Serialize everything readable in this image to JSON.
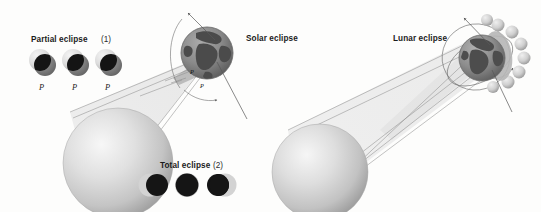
{
  "figure": {
    "background_color": "#fdfdfc",
    "width": 541,
    "height": 212
  },
  "labels": {
    "partial_eclipse": "Partial eclipse",
    "partial_eclipse_num": "(1)",
    "total_eclipse": "Total eclipse",
    "total_eclipse_num": "(2)",
    "solar_eclipse": "Solar eclipse",
    "lunar_eclipse": "Lunar eclipse",
    "p_marker": "P"
  },
  "partial_eclipse_icons": [
    {
      "p_label": "P"
    },
    {
      "p_label": "P"
    },
    {
      "p_label": "P"
    }
  ],
  "total_eclipse_icons": [
    {
      "phase": "partial-left"
    },
    {
      "phase": "total"
    },
    {
      "phase": "partial-right"
    }
  ],
  "shadow_markers": {
    "solar_upper": "P",
    "solar_lower": "P"
  },
  "colors": {
    "sun_light": "#f2f2f2",
    "sun_mid": "#cccccc",
    "sun_edge": "#9a9a9a",
    "earth_ocean": "#8e8e8e",
    "earth_land": "#4a4a4a",
    "shadow_cone": "#ececec",
    "umbra": "#9c9c9c",
    "dark_disc": "#121212",
    "mid_disc": "#7d7d7d",
    "light_disc": "#dedede",
    "ray_stroke": "#8f8f8f",
    "orbit_stroke": "#6e6e6e",
    "text": "#1b1b1b"
  },
  "scene": {
    "solar": {
      "sun_center": [
        118,
        163
      ],
      "sun_radius": 55,
      "earth_center": [
        207,
        53
      ],
      "earth_radius": 26
    },
    "lunar": {
      "sun_center": [
        320,
        172
      ],
      "sun_radius": 48,
      "earth_center": [
        482,
        58
      ],
      "earth_radius": 23
    }
  }
}
